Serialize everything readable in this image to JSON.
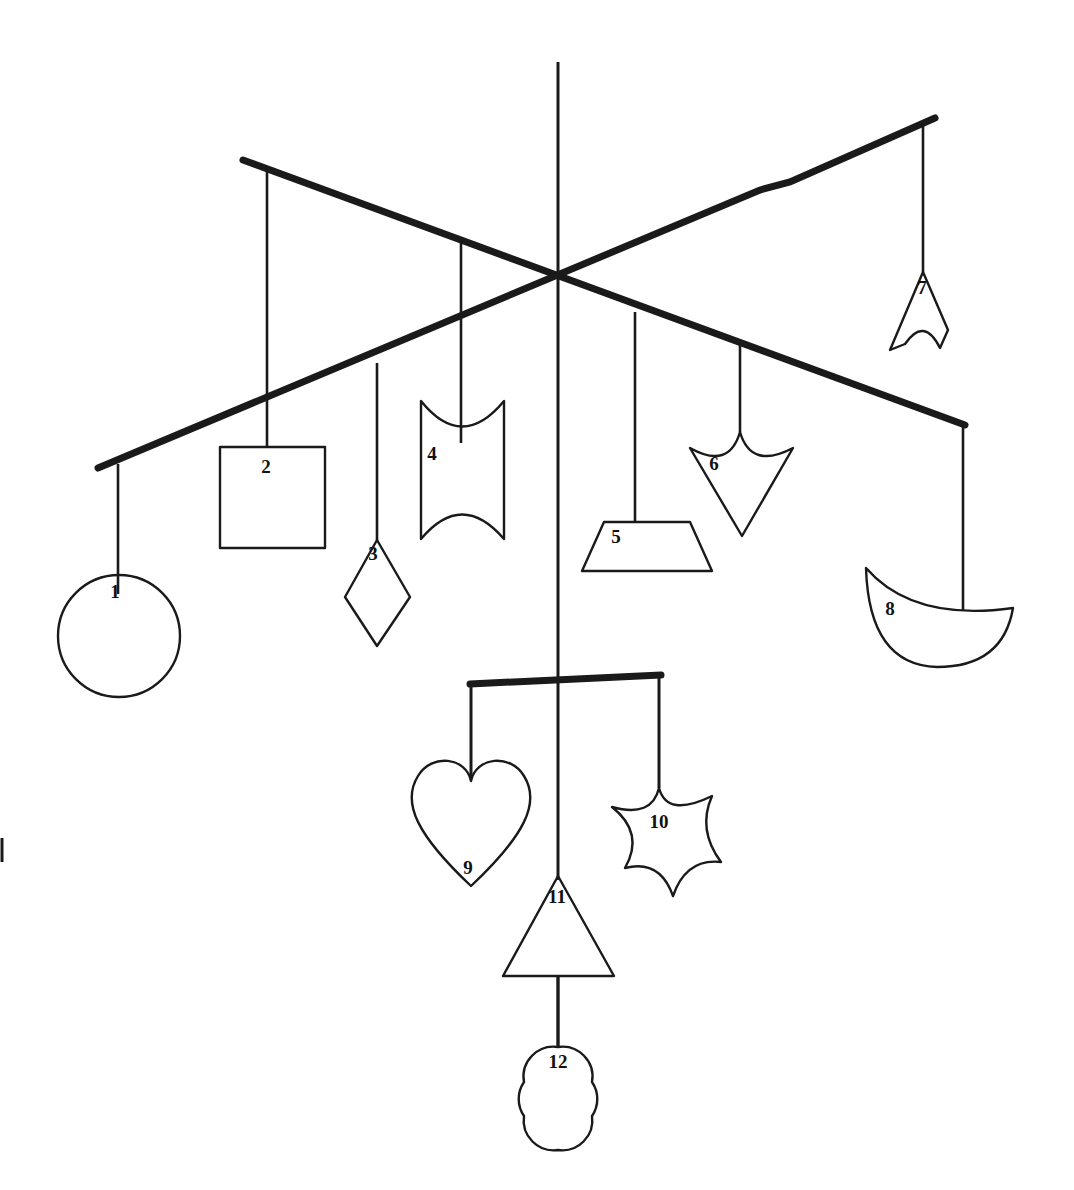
{
  "figure": {
    "background_color": "#ffffff",
    "ink_color": "#1a1a1a",
    "width": 1074,
    "height": 1190
  },
  "labels": {
    "n1": "1",
    "n2": "2",
    "n3": "3",
    "n4": "4",
    "n5": "5",
    "n6": "6",
    "n7": "7",
    "n8": "8",
    "n9": "9",
    "n10": "10",
    "n11": "11",
    "n12": "12"
  },
  "shapes": [
    {
      "number": "1",
      "name": "circle",
      "hangs_from": "bar-b",
      "label_x": 119,
      "label_y": 592
    },
    {
      "number": "2",
      "name": "square",
      "hangs_from": "bar-a",
      "label_x": 261,
      "label_y": 468
    },
    {
      "number": "3",
      "name": "diamond",
      "hangs_from": "bar-b",
      "label_x": 371,
      "label_y": 555
    },
    {
      "number": "4",
      "name": "concave-square",
      "hangs_from": "bar-a",
      "label_x": 430,
      "label_y": 455
    },
    {
      "number": "5",
      "name": "trapezoid",
      "hangs_from": "bar-b",
      "label_x": 613,
      "label_y": 538
    },
    {
      "number": "6",
      "name": "concave-kite",
      "hangs_from": "bar-a",
      "label_x": 711,
      "label_y": 464
    },
    {
      "number": "7",
      "name": "chevron-arrowhead",
      "hangs_from": "bar-b",
      "label_x": 920,
      "label_y": 288
    },
    {
      "number": "8",
      "name": "crescent-bowl",
      "hangs_from": "bar-a",
      "label_x": 888,
      "label_y": 609
    },
    {
      "number": "9",
      "name": "heart",
      "hangs_from": "bar-c",
      "label_x": 466,
      "label_y": 868
    },
    {
      "number": "10",
      "name": "six-point-star",
      "hangs_from": "bar-c",
      "label_x": 655,
      "label_y": 821
    },
    {
      "number": "11",
      "name": "triangle",
      "hangs_from": "center-rod",
      "label_x": 556,
      "label_y": 897
    },
    {
      "number": "12",
      "name": "quatrefoil",
      "hangs_from": "center-rod",
      "label_x": 558,
      "label_y": 1063
    }
  ],
  "structure": {
    "center_rod": {
      "x": 558,
      "y_top": 62,
      "y_bottom": 1047
    },
    "bar_a": {
      "x1": 243,
      "y1": 160,
      "x2": 965,
      "y2": 425,
      "thickness": 7
    },
    "bar_b": {
      "x1": 98,
      "y1": 468,
      "x2": 935,
      "y2": 118,
      "thickness": 7
    },
    "bar_c": {
      "x1": 470,
      "y1": 684,
      "x2": 661,
      "y2": 675,
      "thickness": 7
    }
  }
}
